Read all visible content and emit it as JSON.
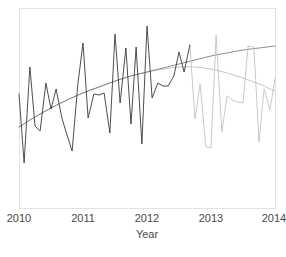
{
  "chart_data": {
    "type": "line",
    "title": "",
    "subtitle": "",
    "xlabel": "Year",
    "ylabel": "",
    "xlim": [
      2010.0,
      2014.0
    ],
    "ylim": [
      0,
      100
    ],
    "grid": false,
    "legend": null,
    "xticks": [
      2010,
      2011,
      2012,
      2013,
      2014
    ],
    "xticklabels": [
      "2010",
      "2011",
      "2012",
      "2013",
      "2014"
    ],
    "yticks": [],
    "yticklabels": [],
    "annotations": [],
    "series": [
      {
        "name": "observed",
        "color": "#3a3a3a",
        "width": 0.9,
        "x": [
          2010.0,
          2010.08,
          2010.17,
          2010.25,
          2010.33,
          2010.42,
          2010.5,
          2010.58,
          2010.67,
          2010.75,
          2010.83,
          2010.92,
          2011.0,
          2011.08,
          2011.17,
          2011.25,
          2011.33,
          2011.42,
          2011.5,
          2011.58,
          2011.67,
          2011.75,
          2011.83,
          2011.92,
          2012.0,
          2012.08,
          2012.17,
          2012.25,
          2012.33,
          2012.42,
          2012.5,
          2012.58,
          2012.67
        ],
        "y": [
          57.0,
          22.5,
          70.5,
          41.0,
          38.5,
          62.5,
          49.5,
          59.5,
          45.0,
          36.5,
          28.5,
          62.0,
          82.5,
          45.0,
          57.0,
          56.5,
          57.5,
          37.5,
          87.0,
          52.5,
          80.0,
          42.0,
          80.5,
          32.0,
          91.0,
          55.0,
          62.5,
          61.0,
          61.0,
          66.0,
          78.0,
          68.0,
          81.5
        ]
      },
      {
        "name": "projected",
        "color": "#c2c2c2",
        "width": 0.9,
        "x": [
          2012.67,
          2012.75,
          2012.83,
          2012.92,
          2013.0,
          2013.08,
          2013.17,
          2013.25,
          2013.33,
          2013.42,
          2013.5,
          2013.58,
          2013.67,
          2013.75,
          2013.83,
          2013.92,
          2014.0
        ],
        "y": [
          81.5,
          44.5,
          62.0,
          30.5,
          30.0,
          86.5,
          38.0,
          56.0,
          54.0,
          53.0,
          52.5,
          81.0,
          80.5,
          33.0,
          59.5,
          49.0,
          64.5
        ]
      },
      {
        "name": "trend-upper",
        "color": "#6e6e6e",
        "width": 0.8,
        "x": [
          2010.0,
          2010.25,
          2010.5,
          2010.75,
          2011.0,
          2011.25,
          2011.5,
          2011.75,
          2012.0,
          2012.25,
          2012.5,
          2012.75,
          2013.0,
          2013.25,
          2013.5,
          2013.75,
          2014.0
        ],
        "y": [
          40.5,
          45.5,
          50.0,
          54.0,
          57.5,
          60.5,
          63.5,
          66.0,
          68.0,
          70.0,
          72.0,
          74.0,
          76.0,
          77.5,
          79.0,
          80.0,
          81.0
        ]
      },
      {
        "name": "trend-lower",
        "color": "#b8b8b8",
        "width": 0.8,
        "x": [
          2010.0,
          2010.25,
          2010.5,
          2010.75,
          2011.0,
          2011.25,
          2011.5,
          2011.75,
          2012.0,
          2012.25,
          2012.5,
          2012.75,
          2013.0,
          2013.25,
          2013.5,
          2013.75,
          2014.0
        ],
        "y": [
          40.5,
          45.5,
          50.0,
          54.0,
          57.5,
          60.5,
          63.5,
          66.0,
          68.0,
          69.5,
          70.5,
          70.5,
          69.5,
          67.5,
          65.0,
          62.0,
          58.5
        ]
      }
    ]
  },
  "axis": {
    "x_title": "Year",
    "tick_2010": "2010",
    "tick_2011": "2011",
    "tick_2012": "2012",
    "tick_2013": "2013",
    "tick_2014": "2014"
  },
  "colors": {
    "observed": "#3a3a3a",
    "projected": "#c2c2c2",
    "trend_upper": "#6e6e6e",
    "trend_lower": "#b8b8b8",
    "panel_border": "#e2e2e2",
    "text": "#4a4a4a",
    "background": "#ffffff"
  }
}
